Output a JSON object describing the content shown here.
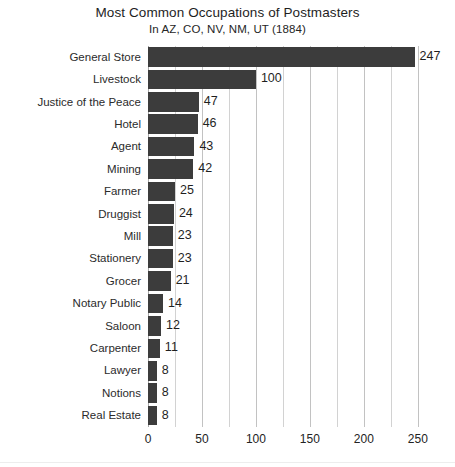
{
  "chart_data": {
    "type": "bar",
    "orientation": "horizontal",
    "title": "Most Common Occupations of Postmasters",
    "subtitle": "In AZ, CO, NV, NM, UT (1884)",
    "xlabel": "",
    "ylabel": "",
    "xlim": [
      0,
      265
    ],
    "xticks": [
      0,
      50,
      100,
      150,
      200,
      250
    ],
    "xtick_labels": [
      "0",
      "50",
      "100",
      "150",
      "200",
      "250"
    ],
    "grid": true,
    "grid_axis": "x",
    "grid_interval": 25,
    "legend": "none",
    "bar_color": "#3c3c3c",
    "show_data_labels": true,
    "categories": [
      "General Store",
      "Livestock",
      "Justice of the Peace",
      "Hotel",
      "Agent",
      "Mining",
      "Farmer",
      "Druggist",
      "Mill",
      "Stationery",
      "Grocer",
      "Notary Public",
      "Saloon",
      "Carpenter",
      "Lawyer",
      "Notions",
      "Real Estate"
    ],
    "values": [
      247,
      100,
      47,
      46,
      43,
      42,
      25,
      24,
      23,
      23,
      21,
      14,
      12,
      11,
      8,
      8,
      8
    ],
    "value_labels": [
      "247",
      "100",
      "47",
      "46",
      "43",
      "42",
      "25",
      "24",
      "23",
      "23",
      "21",
      "14",
      "12",
      "11",
      "8",
      "8",
      "8"
    ]
  }
}
